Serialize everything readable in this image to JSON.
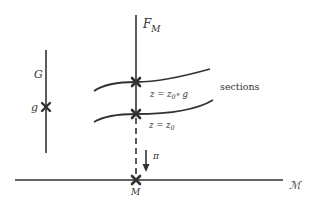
{
  "diagram": {
    "fiber_label": "F",
    "fiber_subscript": "M",
    "group_label": "G",
    "group_element_label": "g",
    "sections_label": "sections",
    "upper_section_label_lhs": "z = z",
    "upper_section_label_sub": "0",
    "upper_section_label_rhs": "∘ g",
    "lower_section_label_lhs": "z = z",
    "lower_section_label_sub": "0",
    "projection_label": "π",
    "point_label": "M",
    "base_space_label": "ℳ"
  },
  "colors": {
    "ink": "#333333",
    "background": "#ffffff"
  }
}
